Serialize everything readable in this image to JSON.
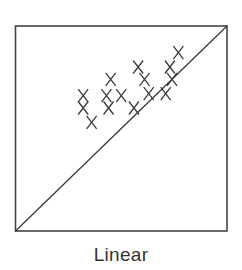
{
  "chart_data": {
    "type": "scatter",
    "title": "",
    "caption": "Linear",
    "xlabel": "",
    "ylabel": "",
    "xlim": [
      0,
      1
    ],
    "ylim": [
      0,
      1
    ],
    "grid": false,
    "legend": null,
    "marker": "x",
    "reference_line": {
      "type": "identity",
      "from": [
        0,
        0
      ],
      "to": [
        1,
        1
      ]
    },
    "series": [
      {
        "name": "points",
        "points": [
          {
            "x": 0.32,
            "y": 0.66
          },
          {
            "x": 0.32,
            "y": 0.6
          },
          {
            "x": 0.36,
            "y": 0.53
          },
          {
            "x": 0.43,
            "y": 0.66
          },
          {
            "x": 0.5,
            "y": 0.66
          },
          {
            "x": 0.44,
            "y": 0.6
          },
          {
            "x": 0.45,
            "y": 0.74
          },
          {
            "x": 0.58,
            "y": 0.8
          },
          {
            "x": 0.61,
            "y": 0.74
          },
          {
            "x": 0.63,
            "y": 0.67
          },
          {
            "x": 0.56,
            "y": 0.6
          },
          {
            "x": 0.73,
            "y": 0.8
          },
          {
            "x": 0.74,
            "y": 0.74
          },
          {
            "x": 0.71,
            "y": 0.67
          },
          {
            "x": 0.77,
            "y": 0.87
          }
        ]
      }
    ]
  },
  "colors": {
    "frame": "#444444",
    "marker": "#3a3a3a",
    "line": "#333333",
    "caption": "#333333"
  }
}
